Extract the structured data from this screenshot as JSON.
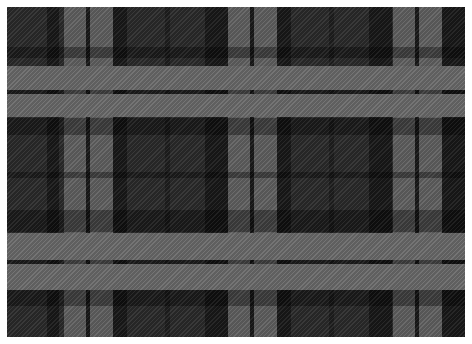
{
  "image": {
    "description": "Gray and black tartan plaid fabric pattern",
    "colors": {
      "ground": "#2a2a2a",
      "black": "#141414",
      "gray_weft_or_warp": "#5e5e5e",
      "gray_intersection": "#8c8c8c",
      "border": "#ffffff"
    },
    "vertical_stripes": [
      {
        "x": 40,
        "w": 12,
        "color": "#141414"
      },
      {
        "x": 57,
        "w": 22,
        "color": "#6a6a6a"
      },
      {
        "x": 79,
        "w": 4,
        "color": "#141414"
      },
      {
        "x": 83,
        "w": 23,
        "color": "#6a6a6a"
      },
      {
        "x": 106,
        "w": 14,
        "color": "#141414"
      },
      {
        "x": 158,
        "w": 5,
        "color": "#1c1c1c"
      },
      {
        "x": 198,
        "w": 23,
        "color": "#141414"
      },
      {
        "x": 221,
        "w": 22,
        "color": "#6a6a6a"
      },
      {
        "x": 243,
        "w": 4,
        "color": "#141414"
      },
      {
        "x": 247,
        "w": 23,
        "color": "#6a6a6a"
      },
      {
        "x": 270,
        "w": 14,
        "color": "#141414"
      },
      {
        "x": 322,
        "w": 5,
        "color": "#1c1c1c"
      },
      {
        "x": 362,
        "w": 23,
        "color": "#141414"
      },
      {
        "x": 386,
        "w": 22,
        "color": "#6a6a6a"
      },
      {
        "x": 408,
        "w": 4,
        "color": "#141414"
      },
      {
        "x": 412,
        "w": 23,
        "color": "#6a6a6a"
      },
      {
        "x": 435,
        "w": 23,
        "color": "#141414"
      }
    ],
    "horizontal_stripes": [
      {
        "y": 40,
        "h": 11,
        "color": "#141414"
      },
      {
        "y": 59,
        "h": 24,
        "color": "#6a6a6a"
      },
      {
        "y": 83,
        "h": 4,
        "color": "#141414"
      },
      {
        "y": 87,
        "h": 23,
        "color": "#6a6a6a"
      },
      {
        "y": 111,
        "h": 17,
        "color": "#141414"
      },
      {
        "y": 165,
        "h": 6,
        "color": "#1c1c1c"
      },
      {
        "y": 203,
        "h": 22,
        "color": "#141414"
      },
      {
        "y": 226,
        "h": 27,
        "color": "#6a6a6a"
      },
      {
        "y": 253,
        "h": 4,
        "color": "#141414"
      },
      {
        "y": 257,
        "h": 26,
        "color": "#6a6a6a"
      },
      {
        "y": 283,
        "h": 16,
        "color": "#141414"
      }
    ]
  }
}
